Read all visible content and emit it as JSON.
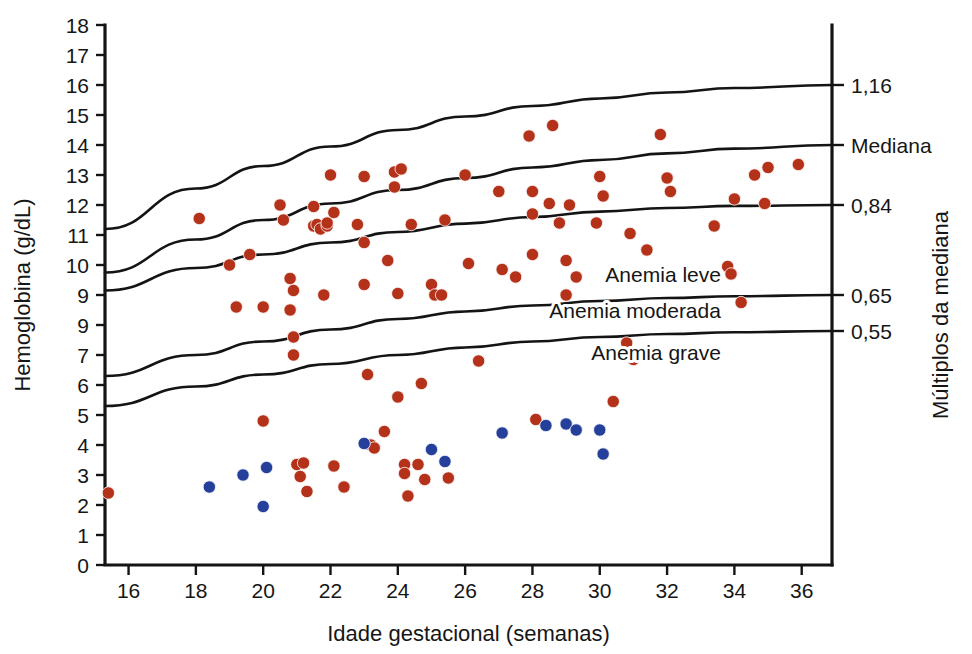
{
  "chart_data": {
    "type": "scatter",
    "title": "",
    "xlabel": "Idade gestacional (semanas)",
    "ylabel": "Hemoglobina (g/dL)",
    "ylabel_right": "Múltiplos da mediana",
    "xlim": [
      15.3,
      36.9
    ],
    "ylim": [
      0,
      18
    ],
    "grid": false,
    "xticks": [
      16,
      18,
      20,
      22,
      24,
      26,
      28,
      30,
      32,
      34,
      36
    ],
    "xtick_labels": [
      "16",
      "18",
      "20",
      "22",
      "24",
      "26",
      "28",
      "30",
      "32",
      "34",
      "36"
    ],
    "yticks": [
      0,
      1,
      2,
      3,
      4,
      5,
      6,
      7,
      8,
      9,
      10,
      11,
      12,
      13,
      14,
      15,
      16,
      17,
      18
    ],
    "ytick_labels": [
      "0",
      "1",
      "2",
      "3",
      "4",
      "5",
      "6",
      "7",
      "9",
      "9",
      "10",
      "11",
      "12",
      "13",
      "14",
      "15",
      "16",
      "17",
      "18"
    ],
    "right_axis_labels": [
      {
        "text": "1,16",
        "y": 16.0
      },
      {
        "text": "Mediana",
        "y": 14.0
      },
      {
        "text": "0,84",
        "y": 12.0
      },
      {
        "text": "0,65",
        "y": 9.0
      },
      {
        "text": "0,55",
        "y": 7.8
      }
    ],
    "band_annotations": [
      {
        "text": "Anemia leve",
        "x": 33.6,
        "y": 9.45
      },
      {
        "text": "Anemia moderada",
        "x": 33.6,
        "y": 8.25
      },
      {
        "text": "Anemia grave",
        "x": 33.6,
        "y": 6.85
      }
    ],
    "reference_curves": [
      {
        "name": "1,16",
        "label": "1,16",
        "points": [
          [
            15.3,
            11.2
          ],
          [
            18,
            12.55
          ],
          [
            20,
            13.3
          ],
          [
            22,
            13.95
          ],
          [
            24,
            14.5
          ],
          [
            26,
            14.95
          ],
          [
            28,
            15.3
          ],
          [
            30,
            15.55
          ],
          [
            32,
            15.75
          ],
          [
            34,
            15.9
          ],
          [
            36.9,
            16.0
          ]
        ]
      },
      {
        "name": "Mediana",
        "label": "Mediana",
        "points": [
          [
            15.3,
            9.75
          ],
          [
            18,
            10.85
          ],
          [
            20,
            11.5
          ],
          [
            22,
            12.05
          ],
          [
            24,
            12.5
          ],
          [
            26,
            12.9
          ],
          [
            28,
            13.25
          ],
          [
            30,
            13.5
          ],
          [
            32,
            13.72
          ],
          [
            34,
            13.88
          ],
          [
            36.9,
            14.0
          ]
        ]
      },
      {
        "name": "0,84",
        "label": "0,84",
        "points": [
          [
            15.3,
            9.15
          ],
          [
            18,
            9.9
          ],
          [
            20,
            10.35
          ],
          [
            22,
            10.75
          ],
          [
            24,
            11.1
          ],
          [
            26,
            11.38
          ],
          [
            28,
            11.6
          ],
          [
            30,
            11.78
          ],
          [
            32,
            11.9
          ],
          [
            34,
            11.97
          ],
          [
            36.9,
            12.0
          ]
        ]
      },
      {
        "name": "0,65",
        "label": "0,65",
        "points": [
          [
            15.3,
            6.3
          ],
          [
            18,
            7.0
          ],
          [
            20,
            7.45
          ],
          [
            22,
            7.85
          ],
          [
            24,
            8.2
          ],
          [
            26,
            8.45
          ],
          [
            28,
            8.65
          ],
          [
            30,
            8.8
          ],
          [
            32,
            8.9
          ],
          [
            34,
            8.96
          ],
          [
            36.9,
            9.0
          ]
        ]
      },
      {
        "name": "0,55",
        "label": "0,55",
        "points": [
          [
            15.3,
            5.3
          ],
          [
            18,
            5.95
          ],
          [
            20,
            6.35
          ],
          [
            22,
            6.7
          ],
          [
            24,
            7.0
          ],
          [
            26,
            7.25
          ],
          [
            28,
            7.45
          ],
          [
            30,
            7.6
          ],
          [
            32,
            7.7
          ],
          [
            34,
            7.76
          ],
          [
            36.9,
            7.8
          ]
        ]
      }
    ],
    "series": [
      {
        "name": "Hemoglobina",
        "color": "#b5321a",
        "marker": "circle",
        "points": [
          [
            15.4,
            2.4
          ],
          [
            18.1,
            11.55
          ],
          [
            19.0,
            10.0
          ],
          [
            19.2,
            8.6
          ],
          [
            19.6,
            10.35
          ],
          [
            20.0,
            8.6
          ],
          [
            20.0,
            4.8
          ],
          [
            20.5,
            12.0
          ],
          [
            20.6,
            11.5
          ],
          [
            20.8,
            9.55
          ],
          [
            20.8,
            8.5
          ],
          [
            20.9,
            9.15
          ],
          [
            20.9,
            7.6
          ],
          [
            20.9,
            7.0
          ],
          [
            21.0,
            3.35
          ],
          [
            21.1,
            2.95
          ],
          [
            21.2,
            3.4
          ],
          [
            21.3,
            2.45
          ],
          [
            21.5,
            11.95
          ],
          [
            21.5,
            11.3
          ],
          [
            21.6,
            11.35
          ],
          [
            21.7,
            11.2
          ],
          [
            21.8,
            9.0
          ],
          [
            21.9,
            11.3
          ],
          [
            21.9,
            11.4
          ],
          [
            22.0,
            13.0
          ],
          [
            22.1,
            11.75
          ],
          [
            22.1,
            3.3
          ],
          [
            22.4,
            2.6
          ],
          [
            22.8,
            11.35
          ],
          [
            23.0,
            12.95
          ],
          [
            23.0,
            10.75
          ],
          [
            23.0,
            9.35
          ],
          [
            23.1,
            6.35
          ],
          [
            23.2,
            4.0
          ],
          [
            23.3,
            3.9
          ],
          [
            23.6,
            4.45
          ],
          [
            23.7,
            10.15
          ],
          [
            23.9,
            13.1
          ],
          [
            23.9,
            12.6
          ],
          [
            24.0,
            9.05
          ],
          [
            24.0,
            5.6
          ],
          [
            24.1,
            13.2
          ],
          [
            24.2,
            3.35
          ],
          [
            24.2,
            3.05
          ],
          [
            24.3,
            2.3
          ],
          [
            24.4,
            11.35
          ],
          [
            24.6,
            3.35
          ],
          [
            24.7,
            6.05
          ],
          [
            24.8,
            2.85
          ],
          [
            25.0,
            9.35
          ],
          [
            25.1,
            9.0
          ],
          [
            25.3,
            9.0
          ],
          [
            25.4,
            11.5
          ],
          [
            25.5,
            2.9
          ],
          [
            26.0,
            13.0
          ],
          [
            26.1,
            10.05
          ],
          [
            26.4,
            6.8
          ],
          [
            27.0,
            12.45
          ],
          [
            27.1,
            9.85
          ],
          [
            27.5,
            9.6
          ],
          [
            27.9,
            14.3
          ],
          [
            28.0,
            12.45
          ],
          [
            28.0,
            11.7
          ],
          [
            28.0,
            10.35
          ],
          [
            28.1,
            4.85
          ],
          [
            28.5,
            12.05
          ],
          [
            28.6,
            14.65
          ],
          [
            28.8,
            11.4
          ],
          [
            29.0,
            9.0
          ],
          [
            29.0,
            10.15
          ],
          [
            29.1,
            12.0
          ],
          [
            29.3,
            9.6
          ],
          [
            29.9,
            11.4
          ],
          [
            30.0,
            12.95
          ],
          [
            30.1,
            12.3
          ],
          [
            30.4,
            5.45
          ],
          [
            30.8,
            7.4
          ],
          [
            30.9,
            11.05
          ],
          [
            31.0,
            6.85
          ],
          [
            31.4,
            10.5
          ],
          [
            31.8,
            14.35
          ],
          [
            32.0,
            12.9
          ],
          [
            32.1,
            12.45
          ],
          [
            33.4,
            11.3
          ],
          [
            33.8,
            9.95
          ],
          [
            33.9,
            9.7
          ],
          [
            34.0,
            12.2
          ],
          [
            34.2,
            8.75
          ],
          [
            34.6,
            13.0
          ],
          [
            34.9,
            12.05
          ],
          [
            35.0,
            13.25
          ],
          [
            35.9,
            13.35
          ]
        ]
      },
      {
        "name": "Hemoglobina baixa",
        "color": "#24409a",
        "marker": "circle",
        "points": [
          [
            18.4,
            2.6
          ],
          [
            19.4,
            3.0
          ],
          [
            20.0,
            1.95
          ],
          [
            20.1,
            3.25
          ],
          [
            23.0,
            4.05
          ],
          [
            25.0,
            3.85
          ],
          [
            25.4,
            3.45
          ],
          [
            27.1,
            4.4
          ],
          [
            28.4,
            4.65
          ],
          [
            29.0,
            4.7
          ],
          [
            29.3,
            4.5
          ],
          [
            30.0,
            4.5
          ],
          [
            30.1,
            3.7
          ]
        ]
      }
    ]
  }
}
